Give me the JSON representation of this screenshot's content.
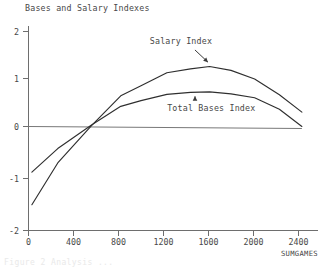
{
  "chart_data": {
    "type": "line",
    "title": "Bases and Salary Indexes",
    "xlabel": "SUMGAMES",
    "ylabel": "",
    "xlim": [
      -70,
      2520
    ],
    "ylim": [
      -2.15,
      2.15
    ],
    "grid": false,
    "legend": "annotations",
    "xticks": [
      0,
      400,
      800,
      1200,
      1600,
      2000,
      2400
    ],
    "xtick_labels": [
      "0",
      "400",
      "800",
      "1200",
      "1600",
      "2000",
      "2400"
    ],
    "yticks": [
      2,
      1,
      0,
      -1,
      -2
    ],
    "ytick_labels": [
      "2",
      "1",
      "0",
      "-1",
      "-2"
    ],
    "reference_lines": [
      {
        "name": "zero-line",
        "y": 0,
        "from_x": 0,
        "to_x": 2430
      }
    ],
    "series": [
      {
        "name": "Salary Index",
        "x": [
          30,
          260,
          560,
          820,
          1000,
          1230,
          1440,
          1610,
          1800,
          2010,
          2230,
          2430
        ],
        "values": [
          -1.63,
          -0.76,
          0.02,
          0.64,
          0.85,
          1.12,
          1.2,
          1.25,
          1.17,
          0.99,
          0.66,
          0.3
        ]
      },
      {
        "name": "Total Bases Index",
        "x": [
          30,
          260,
          560,
          820,
          1000,
          1230,
          1440,
          1610,
          1800,
          2010,
          2230,
          2430
        ],
        "values": [
          -0.95,
          -0.46,
          0.03,
          0.42,
          0.54,
          0.67,
          0.71,
          0.72,
          0.68,
          0.6,
          0.36,
          0.0
        ]
      }
    ],
    "annotations": [
      {
        "name": "Salary Index",
        "text": "Salary Index",
        "label_x": 1355,
        "label_y": 1.72,
        "arrow_kind": "diagonal-down-right",
        "points_to_x": 1595,
        "points_to_y": 1.34
      },
      {
        "name": "Total Bases Index",
        "text": "Total Bases Index",
        "label_x": 1625,
        "label_y": 0.33,
        "arrow_kind": "up",
        "points_to_x": 1480,
        "points_to_y": 0.63
      }
    ]
  },
  "footer": {
    "ghost_text": "Figure 2 Analysis ..."
  }
}
